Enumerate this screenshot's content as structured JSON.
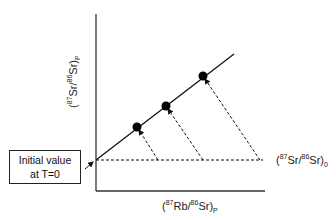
{
  "diagram": {
    "type": "isochron",
    "y_axis_label": {
      "open": "(",
      "sup1": "87",
      "mid": "Sr/",
      "sup2": "86",
      "end": "Sr)",
      "sub": "P"
    },
    "x_axis_label": {
      "open": "(",
      "sup1": "87",
      "mid": "Rb/",
      "sup2": "86",
      "end": "Sr)",
      "sub": "P"
    },
    "initial_ratio_label": {
      "open": "(",
      "sup1": "87",
      "mid": "Sr/",
      "sup2": "86",
      "end": "Sr)",
      "sub": "0"
    },
    "callout": {
      "line1": "Initial value",
      "line2": "at T=0"
    },
    "points": [
      {
        "name": "sample-1",
        "x": 137,
        "y": 127
      },
      {
        "name": "sample-2",
        "x": 166,
        "y": 106
      },
      {
        "name": "sample-3",
        "x": 203,
        "y": 76
      }
    ],
    "colors": {
      "line": "#111111",
      "background": "#ffffff"
    }
  }
}
